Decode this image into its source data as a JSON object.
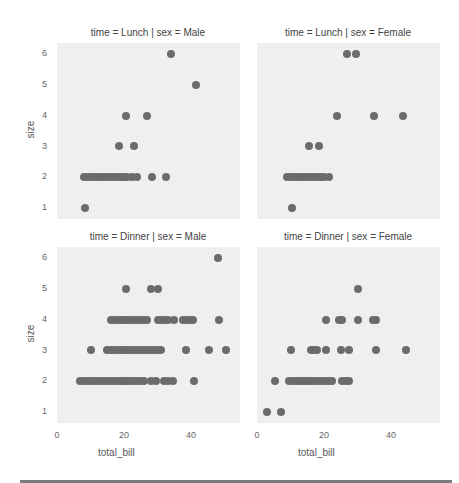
{
  "chart_data": {
    "type": "scatter",
    "layout": "facet-grid 2x2",
    "grid": false,
    "xlabel": "total_bill",
    "ylabel": "size",
    "xlim": [
      0,
      55
    ],
    "ylim": [
      0.65,
      6.35
    ],
    "xticks": [
      "0",
      "20",
      "40"
    ],
    "yticks": [
      "1",
      "2",
      "3",
      "4",
      "5",
      "6"
    ],
    "marker_color": "#6b6b6b",
    "panel_bg": "#efefef",
    "panels": [
      {
        "title": "time = Lunch | sex = Male",
        "points": [
          [
            34,
            6
          ],
          [
            41.5,
            5
          ],
          [
            20.5,
            4
          ],
          [
            27,
            4
          ],
          [
            18.5,
            3
          ],
          [
            23,
            3
          ],
          [
            8,
            2
          ],
          [
            9,
            2
          ],
          [
            10,
            2
          ],
          [
            11,
            2
          ],
          [
            12,
            2
          ],
          [
            13,
            2
          ],
          [
            14,
            2
          ],
          [
            15,
            2
          ],
          [
            16,
            2
          ],
          [
            17,
            2
          ],
          [
            18,
            2
          ],
          [
            19,
            2
          ],
          [
            20,
            2
          ],
          [
            21,
            2
          ],
          [
            22.5,
            2
          ],
          [
            24,
            2
          ],
          [
            28.5,
            2
          ],
          [
            32.5,
            2
          ],
          [
            8.5,
            1
          ]
        ]
      },
      {
        "title": "time = Lunch | sex = Female",
        "points": [
          [
            27,
            6
          ],
          [
            29.5,
            6
          ],
          [
            24,
            4
          ],
          [
            35,
            4
          ],
          [
            43.5,
            4
          ],
          [
            15.5,
            3
          ],
          [
            18.5,
            3
          ],
          [
            9,
            2
          ],
          [
            10,
            2
          ],
          [
            11,
            2
          ],
          [
            12,
            2
          ],
          [
            13,
            2
          ],
          [
            14,
            2
          ],
          [
            15,
            2
          ],
          [
            16,
            2
          ],
          [
            17,
            2
          ],
          [
            18,
            2
          ],
          [
            19,
            2
          ],
          [
            20,
            2
          ],
          [
            21.5,
            2
          ],
          [
            10.5,
            1
          ]
        ]
      },
      {
        "title": "time = Dinner | sex = Male",
        "points": [
          [
            48,
            6
          ],
          [
            20.5,
            5
          ],
          [
            28,
            5
          ],
          [
            30,
            5
          ],
          [
            16,
            4
          ],
          [
            17,
            4
          ],
          [
            18,
            4
          ],
          [
            19,
            4
          ],
          [
            20,
            4
          ],
          [
            21,
            4
          ],
          [
            22,
            4
          ],
          [
            23,
            4
          ],
          [
            24,
            4
          ],
          [
            25,
            4
          ],
          [
            26,
            4
          ],
          [
            27,
            4
          ],
          [
            30,
            4
          ],
          [
            31,
            4
          ],
          [
            32,
            4
          ],
          [
            33,
            4
          ],
          [
            35,
            4
          ],
          [
            37.5,
            4
          ],
          [
            38.5,
            4
          ],
          [
            39.5,
            4
          ],
          [
            40.5,
            4
          ],
          [
            48.5,
            4
          ],
          [
            10,
            3
          ],
          [
            15,
            3
          ],
          [
            16,
            3
          ],
          [
            17,
            3
          ],
          [
            18,
            3
          ],
          [
            19,
            3
          ],
          [
            20,
            3
          ],
          [
            21,
            3
          ],
          [
            22,
            3
          ],
          [
            23,
            3
          ],
          [
            24,
            3
          ],
          [
            25,
            3
          ],
          [
            26,
            3
          ],
          [
            27,
            3
          ],
          [
            28,
            3
          ],
          [
            29,
            3
          ],
          [
            30,
            3
          ],
          [
            31,
            3
          ],
          [
            38.5,
            3
          ],
          [
            45.5,
            3
          ],
          [
            50.5,
            3
          ],
          [
            7,
            2
          ],
          [
            8,
            2
          ],
          [
            9,
            2
          ],
          [
            10,
            2
          ],
          [
            11,
            2
          ],
          [
            12,
            2
          ],
          [
            13,
            2
          ],
          [
            14,
            2
          ],
          [
            15,
            2
          ],
          [
            16,
            2
          ],
          [
            17,
            2
          ],
          [
            18,
            2
          ],
          [
            19,
            2
          ],
          [
            20,
            2
          ],
          [
            21,
            2
          ],
          [
            22,
            2
          ],
          [
            23,
            2
          ],
          [
            24,
            2
          ],
          [
            25,
            2
          ],
          [
            26,
            2
          ],
          [
            28,
            2
          ],
          [
            29.5,
            2
          ],
          [
            32,
            2
          ],
          [
            33,
            2
          ],
          [
            34.5,
            2
          ],
          [
            41,
            2
          ]
        ]
      },
      {
        "title": "time = Dinner | sex = Female",
        "points": [
          [
            30,
            5
          ],
          [
            20.5,
            4
          ],
          [
            24.5,
            4
          ],
          [
            25.5,
            4
          ],
          [
            30,
            4
          ],
          [
            34.5,
            4
          ],
          [
            35.5,
            4
          ],
          [
            10,
            3
          ],
          [
            16,
            3
          ],
          [
            17,
            3
          ],
          [
            18,
            3
          ],
          [
            20.5,
            3
          ],
          [
            25,
            3
          ],
          [
            27.5,
            3
          ],
          [
            35.5,
            3
          ],
          [
            44.5,
            3
          ],
          [
            5.5,
            2
          ],
          [
            9.5,
            2
          ],
          [
            10.5,
            2
          ],
          [
            11.5,
            2
          ],
          [
            12.5,
            2
          ],
          [
            13.5,
            2
          ],
          [
            14.5,
            2
          ],
          [
            15.5,
            2
          ],
          [
            16.5,
            2
          ],
          [
            17.5,
            2
          ],
          [
            18.5,
            2
          ],
          [
            19.5,
            2
          ],
          [
            20.5,
            2
          ],
          [
            21.5,
            2
          ],
          [
            22.5,
            2
          ],
          [
            25.5,
            2
          ],
          [
            26.5,
            2
          ],
          [
            27.5,
            2
          ],
          [
            3,
            1
          ],
          [
            7.25,
            1
          ]
        ]
      }
    ]
  },
  "labels": {
    "titles": [
      "time = Lunch | sex = Male",
      "time = Lunch | sex = Female",
      "time = Dinner | sex = Male",
      "time = Dinner | sex = Female"
    ],
    "ylabel": "size",
    "xlabel": "total_bill",
    "yticks": [
      "6",
      "5",
      "4",
      "3",
      "2",
      "1"
    ],
    "xticks": [
      "0",
      "20",
      "40"
    ]
  }
}
